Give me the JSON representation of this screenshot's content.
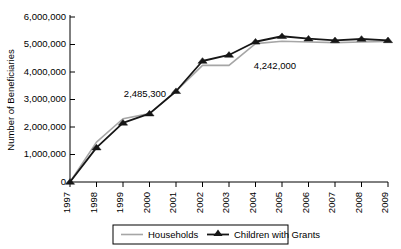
{
  "chart_data": {
    "type": "line",
    "title": "",
    "xlabel": "",
    "ylabel": "Number of Beneficiaries",
    "categories": [
      "1997",
      "1998",
      "1999",
      "2000",
      "2001",
      "2002",
      "2003",
      "2004",
      "2005",
      "2006",
      "2007",
      "2008",
      "2009"
    ],
    "x": [
      1997,
      1998,
      1999,
      2000,
      2001,
      2002,
      2003,
      2004,
      2005,
      2006,
      2007,
      2008,
      2009
    ],
    "ylim": [
      0,
      6000000
    ],
    "ytick_values": [
      0,
      1000000,
      2000000,
      3000000,
      4000000,
      5000000,
      6000000
    ],
    "ytick_labels": [
      "0",
      "1,000,000",
      "2,000,000",
      "3,000,000",
      "4,000,000",
      "5,000,000",
      "6,000,000"
    ],
    "grid": false,
    "legend_position": "bottom",
    "series": [
      {
        "name": "Households",
        "color": "#a6a6a6",
        "marker": "none",
        "values": [
          0,
          1450000,
          2300000,
          2485300,
          3300000,
          4242000,
          4242000,
          5030000,
          5120000,
          5090000,
          5070000,
          5090000,
          5110000
        ]
      },
      {
        "name": "Children with Grants",
        "color": "#161616",
        "marker": "triangle",
        "values": [
          0,
          1250000,
          2150000,
          2485300,
          3300000,
          4400000,
          4620000,
          5100000,
          5300000,
          5210000,
          5150000,
          5200000,
          5150000
        ]
      }
    ],
    "annotations": [
      {
        "text": "2,485,300",
        "x_value": 2000,
        "y_value": 2485300,
        "label_x": 145,
        "label_y": 97
      },
      {
        "text": "4,242,000",
        "x_value": 2003,
        "y_value": 4242000,
        "label_x": 275,
        "label_y": 69
      }
    ]
  },
  "legend": {
    "items": [
      {
        "label": "Households",
        "swatch": "line-swatch-gray"
      },
      {
        "label": "Children with Grants",
        "swatch": "line-marker-swatch-black"
      }
    ]
  }
}
